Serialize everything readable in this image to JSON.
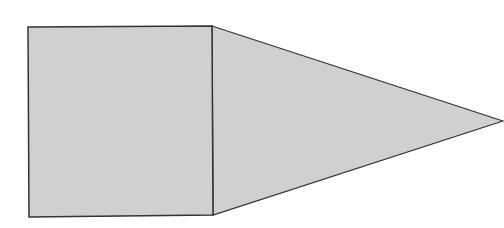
{
  "diagram": {
    "type": "geometric-shape",
    "colors": {
      "fill": "#d0d0d0",
      "stroke": "#333333",
      "background": "#ffffff"
    },
    "shapes": {
      "square": {
        "points": "28,27 212,26 213,215 29,217"
      },
      "triangle": {
        "points": "212,26 503,121 213,215"
      }
    }
  }
}
